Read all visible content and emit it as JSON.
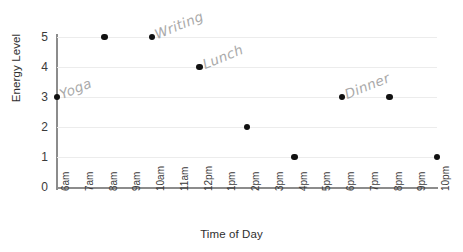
{
  "chart_data": {
    "type": "scatter",
    "title": "",
    "xlabel": "Time of Day",
    "ylabel": "Energy Level",
    "ylim": [
      0,
      5
    ],
    "yticks": [
      "0",
      "1",
      "2",
      "3",
      "4",
      "5"
    ],
    "grid": true,
    "legend": "none",
    "categories": [
      "6am",
      "7am",
      "8am",
      "9am",
      "10am",
      "11am",
      "12pm",
      "1pm",
      "2pm",
      "3pm",
      "4pm",
      "5pm",
      "6pm",
      "7pm",
      "8pm",
      "9pm",
      "10pm"
    ],
    "points": [
      {
        "x": "6am",
        "y": 3
      },
      {
        "x": "8am",
        "y": 5
      },
      {
        "x": "10am",
        "y": 5
      },
      {
        "x": "12pm",
        "y": 4
      },
      {
        "x": "2pm",
        "y": 2
      },
      {
        "x": "4pm",
        "y": 1
      },
      {
        "x": "6pm",
        "y": 3
      },
      {
        "x": "8pm",
        "y": 3
      },
      {
        "x": "10pm",
        "y": 1
      }
    ],
    "annotations": [
      {
        "text": "Yoga",
        "x": "6am",
        "y": 3
      },
      {
        "text": "Writing",
        "x": "10am",
        "y": 5
      },
      {
        "text": "Lunch",
        "x": "12pm",
        "y": 4
      },
      {
        "text": "Dinner",
        "x": "6pm",
        "y": 3
      }
    ],
    "marker_color": "#111111",
    "grid_color": "#ececec",
    "axis_color": "#8c8c8c",
    "annotation_color": "#a9a9a9"
  }
}
